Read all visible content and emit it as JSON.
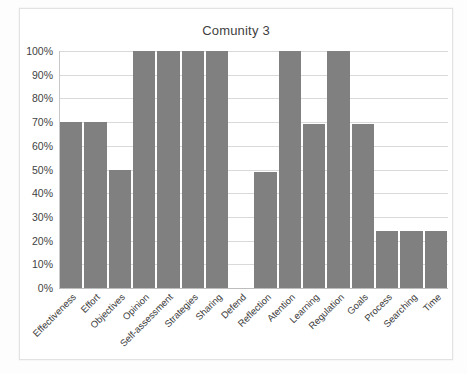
{
  "chart_data": {
    "type": "bar",
    "title": "Comunity 3",
    "xlabel": "",
    "ylabel": "",
    "ylim": [
      0,
      100
    ],
    "y_tick_labels": [
      "100%",
      "90%",
      "80%",
      "70%",
      "60%",
      "50%",
      "40%",
      "30%",
      "20%",
      "10%",
      "0%"
    ],
    "y_tick_values": [
      100,
      90,
      80,
      70,
      60,
      50,
      40,
      30,
      20,
      10,
      0
    ],
    "grid": true,
    "legend": false,
    "legend_position": "none",
    "bar_color": "#808080",
    "gridline_color": "#d9d9d9",
    "categories": [
      "Effectiveness",
      "Effort",
      "Objectives",
      "Opinion",
      "Self-assessment",
      "Strategies",
      "Sharing",
      "Defend",
      "Reflection",
      "Atention",
      "Learning",
      "Regulation",
      "Goals",
      "Process",
      "Searching",
      "Time"
    ],
    "values": [
      70,
      70,
      50,
      100,
      100,
      100,
      100,
      0,
      49,
      100,
      69,
      100,
      69,
      24,
      24,
      24
    ]
  }
}
